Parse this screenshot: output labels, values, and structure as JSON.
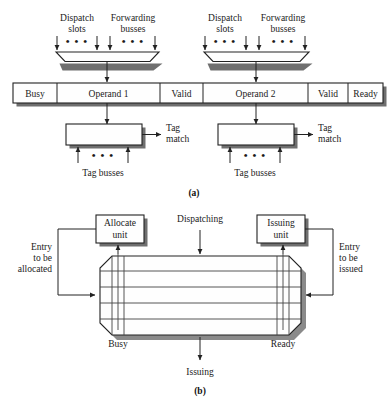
{
  "figure": {
    "panel_a": {
      "caption": "(a)",
      "mux_left": {
        "input_group_1_label_line1": "Dispatch",
        "input_group_1_label_line2": "slots",
        "input_group_2_label_line1": "Forwarding",
        "input_group_2_label_line2": "busses",
        "ellipsis": "• • •"
      },
      "mux_right": {
        "input_group_1_label_line1": "Dispatch",
        "input_group_1_label_line2": "slots",
        "input_group_2_label_line1": "Forwarding",
        "input_group_2_label_line2": "busses",
        "ellipsis": "• • •"
      },
      "entry_bar": {
        "cells": [
          {
            "label": "Busy"
          },
          {
            "label": "Operand 1"
          },
          {
            "label": "Valid"
          },
          {
            "label": "Operand 2"
          },
          {
            "label": "Valid"
          },
          {
            "label": "Ready"
          }
        ]
      },
      "comparator_left": {
        "output_line1": "Tag",
        "output_line2": "match",
        "input_label": "Tag busses",
        "ellipsis": "• • •"
      },
      "comparator_right": {
        "output_line1": "Tag",
        "output_line2": "match",
        "input_label": "Tag busses",
        "ellipsis": "• • •"
      }
    },
    "panel_b": {
      "caption": "(b)",
      "allocate_unit_line1": "Allocate",
      "allocate_unit_line2": "unit",
      "issuing_unit_line1": "Issuing",
      "issuing_unit_line2": "unit",
      "dispatching_label": "Dispatching",
      "issuing_label": "Issuing",
      "busy_label": "Busy",
      "ready_label": "Ready",
      "entry_alloc_line1": "Entry",
      "entry_alloc_line2": "to be",
      "entry_alloc_line3": "allocated",
      "entry_issue_line1": "Entry",
      "entry_issue_line2": "to be",
      "entry_issue_line3": "issued"
    }
  },
  "colors": {
    "ink": "#1a1a1a",
    "line": "#222222",
    "shadow": "#6f6f6f",
    "paper": "#ffffff"
  }
}
